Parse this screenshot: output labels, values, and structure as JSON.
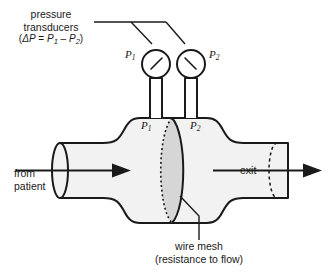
{
  "figure": {
    "title_label": "pressure transducers",
    "labels": {
      "transducer_line1": "pressure",
      "transducer_line2": "transducers",
      "delta_p_open": "(",
      "delta_p_symbol": "ΔP",
      "delta_p_equals": " = ",
      "delta_p_p1": "P",
      "delta_p_sub1": "1",
      "delta_p_minus": " – ",
      "delta_p_p2": "P",
      "delta_p_sub2": "2",
      "delta_p_close": ")",
      "gauge_p1": "P",
      "gauge_p1_sub": "1",
      "gauge_p2": "P",
      "gauge_p2_sub": "2",
      "chamber_p1": "P",
      "chamber_p1_sub": "1",
      "chamber_p2": "P",
      "chamber_p2_sub": "2",
      "inlet_line1": "from",
      "inlet_line2": "patient",
      "outlet": "exit",
      "mesh_line1": "wire mesh",
      "mesh_line2": "(resistance to flow)"
    },
    "colors": {
      "stroke": "#1a1a1a",
      "tube_fill": "#f2f2f2",
      "mesh_fill": "#d6d6d6",
      "background": "#ffffff",
      "text": "#1a1a1a"
    },
    "flow": {
      "inlet_direction": "right",
      "outlet_direction": "right"
    },
    "gauges": [
      {
        "name": "P1",
        "needle_direction": "upper-right"
      },
      {
        "name": "P2",
        "needle_direction": "upper-left"
      }
    ]
  }
}
